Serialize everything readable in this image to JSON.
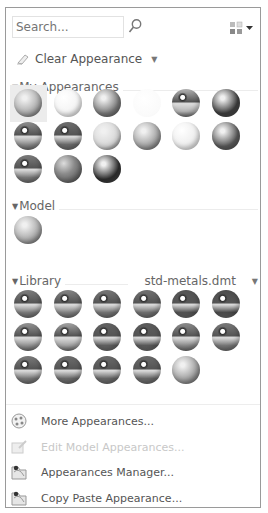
{
  "search": {
    "placeholder": "Search..."
  },
  "toolbar": {
    "view_icon": "thumbnail-view-icon"
  },
  "clear_appearance": {
    "label": "Clear Appearance"
  },
  "sections": {
    "my_appearances": {
      "label": "My Appearances",
      "spheres": [
        {
          "base": "#a9a9a9",
          "style": "matte",
          "selected": true
        },
        {
          "base": "#f4f4f4",
          "style": "white"
        },
        {
          "base": "#7a7a7a",
          "style": "matte"
        },
        {
          "base": "#ffffff",
          "style": "clear"
        },
        {
          "base": "#b5b5b5",
          "style": "chrome"
        },
        {
          "base": "#3e3e3e",
          "style": "matte"
        },
        {
          "base": "#8e8e8e",
          "style": "chrome"
        },
        {
          "base": "#6e6e6e",
          "style": "metal"
        },
        {
          "base": "#d6d6d6",
          "style": "matte"
        },
        {
          "base": "#a0a0a0",
          "style": "matte"
        },
        {
          "base": "#eeeeee",
          "style": "white"
        },
        {
          "base": "#5a5a5a",
          "style": "matte"
        },
        {
          "base": "#7c7c7c",
          "style": "metal"
        },
        {
          "base": "#8a8a8a",
          "style": "marble"
        },
        {
          "base": "#2e2e2e",
          "style": "matte"
        }
      ]
    },
    "model": {
      "label": "Model",
      "spheres": [
        {
          "base": "#a6a6a6",
          "style": "matte"
        }
      ]
    },
    "library": {
      "label": "Library",
      "file": "std-metals.dmt",
      "spheres": [
        {
          "base": "#7e7e7e",
          "style": "metal"
        },
        {
          "base": "#858585",
          "style": "metal"
        },
        {
          "base": "#777777",
          "style": "metal"
        },
        {
          "base": "#727272",
          "style": "metal"
        },
        {
          "base": "#555555",
          "style": "metal"
        },
        {
          "base": "#4d4d4d",
          "style": "metal"
        },
        {
          "base": "#959595",
          "style": "chrome"
        },
        {
          "base": "#a5a5a5",
          "style": "chrome"
        },
        {
          "base": "#626262",
          "style": "metal"
        },
        {
          "base": "#5c5c5c",
          "style": "metal"
        },
        {
          "base": "#8d8d8d",
          "style": "metal"
        },
        {
          "base": "#7a7a7a",
          "style": "metal"
        },
        {
          "base": "#7b7b7b",
          "style": "metal"
        },
        {
          "base": "#6d6d6d",
          "style": "metal"
        },
        {
          "base": "#6a6a6a",
          "style": "metal"
        },
        {
          "base": "#6b6b6b",
          "style": "metal"
        },
        {
          "base": "#9a9a9a",
          "style": "matte"
        }
      ]
    }
  },
  "menu": [
    {
      "label": "More Appearances...",
      "icon": "more-appearances-icon",
      "enabled": true
    },
    {
      "label": "Edit Model Appearances...",
      "icon": "edit-model-appearances-icon",
      "enabled": false
    },
    {
      "label": "Appearances Manager...",
      "icon": "appearances-manager-icon",
      "enabled": true
    },
    {
      "label": "Copy Paste Appearance...",
      "icon": "copy-paste-appearance-icon",
      "enabled": true
    }
  ]
}
